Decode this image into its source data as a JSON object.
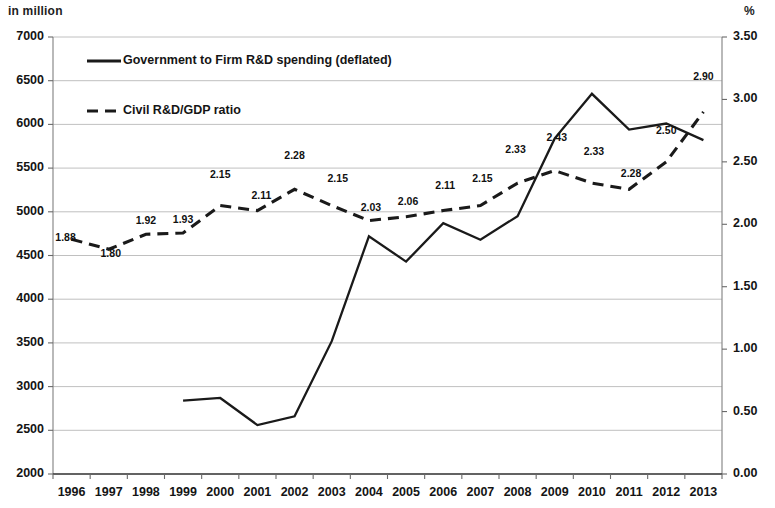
{
  "axes": {
    "left_unit": "in million",
    "right_unit": "%",
    "left_ticks": [
      "7000",
      "6500",
      "6000",
      "5500",
      "5000",
      "4500",
      "4000",
      "3500",
      "3000",
      "2500",
      "2000"
    ],
    "right_ticks": [
      "3.50",
      "3.00",
      "2.50",
      "2.00",
      "1.50",
      "1.00",
      "0.50",
      "0.00"
    ],
    "x_ticks": [
      "1996",
      "1997",
      "1998",
      "1999",
      "2000",
      "2001",
      "2002",
      "2003",
      "2004",
      "2005",
      "2006",
      "2007",
      "2008",
      "2009",
      "2010",
      "2011",
      "2012",
      "2013"
    ]
  },
  "legend": {
    "series1_label": "Government to Firm R&D spending (deflated)",
    "series2_label": "Civil R&D/GDP ratio"
  },
  "chart_data": {
    "type": "line",
    "title": "",
    "xlabel": "",
    "ylabel": "in million",
    "y2label": "%",
    "grid": true,
    "legend_position": "top-left",
    "categories": [
      "1996",
      "1997",
      "1998",
      "1999",
      "2000",
      "2001",
      "2002",
      "2003",
      "2004",
      "2005",
      "2006",
      "2007",
      "2008",
      "2009",
      "2010",
      "2011",
      "2012",
      "2013"
    ],
    "ylim": [
      2000,
      7000
    ],
    "y2lim": [
      0.0,
      3.5
    ],
    "series": [
      {
        "name": "Government to Firm R&D spending (deflated)",
        "axis": "left",
        "style": "solid",
        "color": "#1a1a1a",
        "values": [
          null,
          null,
          null,
          2840,
          2870,
          2560,
          2660,
          3520,
          4720,
          4430,
          4870,
          4680,
          4950,
          5840,
          6350,
          5940,
          6010,
          5820
        ]
      },
      {
        "name": "Civil R&D/GDP ratio",
        "axis": "right",
        "style": "dashed",
        "color": "#1a1a1a",
        "values": [
          1.88,
          1.8,
          1.92,
          1.93,
          2.15,
          2.11,
          2.28,
          2.15,
          2.03,
          2.06,
          2.11,
          2.15,
          2.33,
          2.43,
          2.33,
          2.28,
          2.5,
          2.9
        ],
        "data_labels": [
          "1.88",
          "1.80",
          "1.92",
          "1.93",
          "2.15",
          "2.11",
          "2.28",
          "2.15",
          "2.03",
          "2.06",
          "2.11",
          "2.15",
          "2.33",
          "2.43",
          "2.33",
          "2.28",
          "2.50",
          "2.90"
        ]
      }
    ]
  }
}
